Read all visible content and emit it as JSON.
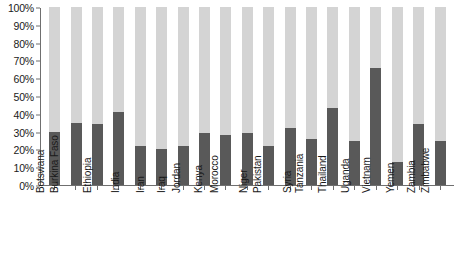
{
  "chart_data": {
    "type": "bar",
    "title": "",
    "subtitle": "",
    "xlabel": "",
    "ylabel": "",
    "ylim": [
      0,
      100
    ],
    "grid": false,
    "legend": "none",
    "stacked": true,
    "value_unit": "%",
    "categories": [
      "Botswana",
      "Burkina Faso",
      "Ethiopia",
      "India",
      "Iran",
      "Iraq",
      "Jordan",
      "Kenya",
      "Morocco",
      "Niger",
      "Pakistan",
      "Syria",
      "Tanzania",
      "Thailand",
      "Uganda",
      "Vietnam",
      "Yemen",
      "Zambia",
      "Zimbabwe"
    ],
    "series": [
      {
        "name": "value",
        "color": "#595959",
        "values": [
          30,
          35,
          34,
          41,
          22,
          20,
          22,
          29,
          28,
          29,
          22,
          32,
          26,
          43,
          25,
          66,
          13,
          34,
          25
        ]
      },
      {
        "name": "remainder",
        "color": "#d4d4d4",
        "values": [
          70,
          65,
          66,
          59,
          78,
          80,
          78,
          71,
          72,
          71,
          78,
          68,
          74,
          57,
          75,
          34,
          87,
          66,
          75
        ]
      }
    ],
    "y_ticks": [
      "0%",
      "10%",
      "20%",
      "30%",
      "40%",
      "50%",
      "60%",
      "70%",
      "80%",
      "90%",
      "100%"
    ],
    "y_tick_values": [
      0,
      10,
      20,
      30,
      40,
      50,
      60,
      70,
      80,
      90,
      100
    ],
    "colors": {
      "bar_value": "#595959",
      "bar_remainder": "#d4d4d4",
      "axis": "#6f6f6f",
      "text": "#1a1a1a",
      "background": "#ffffff"
    }
  }
}
